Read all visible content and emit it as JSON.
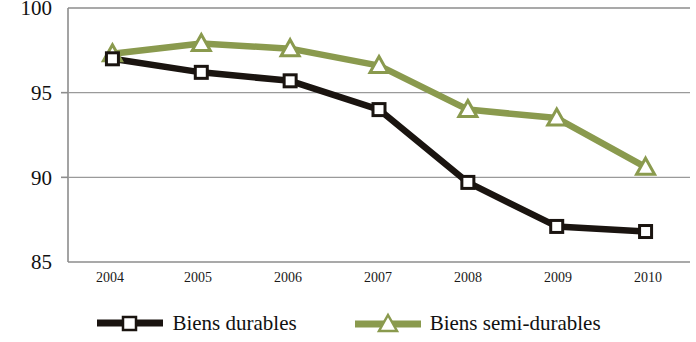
{
  "chart_data": {
    "type": "line",
    "title": "",
    "xlabel": "",
    "ylabel": "",
    "categories": [
      "2004",
      "2005",
      "2006",
      "2007",
      "2008",
      "2009",
      "2010"
    ],
    "ylim": [
      85,
      100
    ],
    "yticks": [
      85,
      90,
      95,
      100
    ],
    "grid": "horizontal",
    "legend_position": "bottom",
    "series": [
      {
        "name": "Biens durables",
        "color": "#1a1410",
        "marker": "square",
        "values": [
          97.0,
          96.2,
          95.7,
          94.0,
          89.7,
          87.1,
          86.8
        ]
      },
      {
        "name": "Biens semi-durables",
        "color": "#8a9a4e",
        "marker": "triangle",
        "values": [
          97.3,
          97.9,
          97.6,
          96.6,
          94.0,
          93.5,
          90.6
        ]
      }
    ]
  },
  "axis": {
    "y_labels": [
      "100",
      "95",
      "90",
      "85"
    ],
    "x_labels": [
      "2004",
      "2005",
      "2006",
      "2007",
      "2008",
      "2009",
      "2010"
    ]
  },
  "legend": {
    "items": [
      {
        "label": "Biens durables"
      },
      {
        "label": "Biens semi-durables"
      }
    ]
  }
}
